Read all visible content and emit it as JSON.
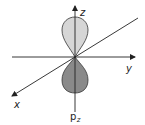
{
  "diagram": {
    "axes": {
      "x": {
        "label": "x"
      },
      "y": {
        "label": "y"
      },
      "z": {
        "label": "z"
      }
    },
    "orbital": {
      "label_main": "p",
      "label_sub": "z",
      "upper_lobe_color": "#d6d6d6",
      "lower_lobe_color": "#8a8a8a",
      "outline_color": "#333333"
    }
  }
}
